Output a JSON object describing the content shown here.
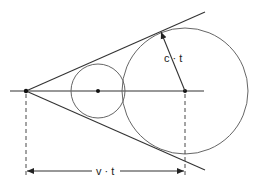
{
  "diagram": {
    "type": "geometry",
    "labels": {
      "radius": "c · t",
      "distance": "v · t"
    },
    "points": {
      "apex": [
        26,
        91
      ],
      "small_center": [
        98,
        91
      ],
      "large_center": [
        185,
        91
      ]
    },
    "circles": [
      {
        "name": "small-wavefront",
        "cx": 98,
        "cy": 91,
        "r": 27
      },
      {
        "name": "large-wavefront",
        "cx": 185,
        "cy": 91,
        "r": 63
      }
    ],
    "colors": {
      "line": "#333333",
      "circle": "#666666",
      "background": "#ffffff"
    }
  }
}
